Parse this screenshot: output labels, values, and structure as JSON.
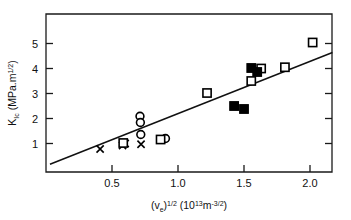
{
  "chart_data": {
    "type": "scatter",
    "title": "",
    "xlabel": "(ve)^1/2 (10^13 m^-3/2)",
    "ylabel": "KIc (MPa.m^1/2)",
    "xlabel_parts": {
      "open_paren": "(",
      "v": "v",
      "v_sub": "e",
      "close_paren": ")",
      "exp": "1/2",
      "unit_open": " (10",
      "unit_exp": "13",
      "unit_m": "m",
      "unit_m_exp": "-3/2",
      "unit_close": ")"
    },
    "ylabel_parts": {
      "k": "K",
      "k_sub": "Ic",
      "unit_open": " (MPa.m",
      "unit_exp": "1/2",
      "unit_close": ")"
    },
    "xlim": [
      0.0,
      2.17
    ],
    "ylim": [
      0.0,
      5.6
    ],
    "xticks": [
      0.5,
      1.0,
      1.5,
      2.0
    ],
    "xticklabels": [
      "0.5",
      "1.0",
      "1.5",
      "2.0"
    ],
    "yticks": [
      1,
      2,
      3,
      4,
      5
    ],
    "yticklabels": [
      "1",
      "2",
      "3",
      "4",
      "5"
    ],
    "grid": false,
    "legend": "none",
    "trendline": {
      "label": "linear fit",
      "x0": 0.03,
      "y0": 0.17,
      "x1": 2.17,
      "y1": 4.64
    },
    "series": [
      {
        "name": "cross",
        "marker": "x",
        "points": [
          {
            "x": 0.41,
            "y": 0.78
          },
          {
            "x": 0.58,
            "y": 0.92
          },
          {
            "x": 0.6,
            "y": 1.0
          },
          {
            "x": 0.72,
            "y": 0.97
          }
        ]
      },
      {
        "name": "open-circle",
        "marker": "circle-open",
        "points": [
          {
            "x": 0.712,
            "y": 2.09
          },
          {
            "x": 0.715,
            "y": 1.84
          },
          {
            "x": 0.718,
            "y": 1.36
          },
          {
            "x": 0.905,
            "y": 1.2
          }
        ]
      },
      {
        "name": "open-square",
        "marker": "square-open",
        "points": [
          {
            "x": 0.585,
            "y": 1.02
          },
          {
            "x": 0.868,
            "y": 1.16
          },
          {
            "x": 1.22,
            "y": 3.02
          },
          {
            "x": 1.555,
            "y": 3.5
          },
          {
            "x": 1.63,
            "y": 4.0
          },
          {
            "x": 1.81,
            "y": 4.05
          },
          {
            "x": 2.02,
            "y": 5.04
          }
        ]
      },
      {
        "name": "filled-square",
        "marker": "square-filled",
        "points": [
          {
            "x": 1.425,
            "y": 2.5
          },
          {
            "x": 1.5,
            "y": 2.38
          },
          {
            "x": 1.555,
            "y": 4.02
          },
          {
            "x": 1.6,
            "y": 3.86
          }
        ]
      }
    ]
  }
}
